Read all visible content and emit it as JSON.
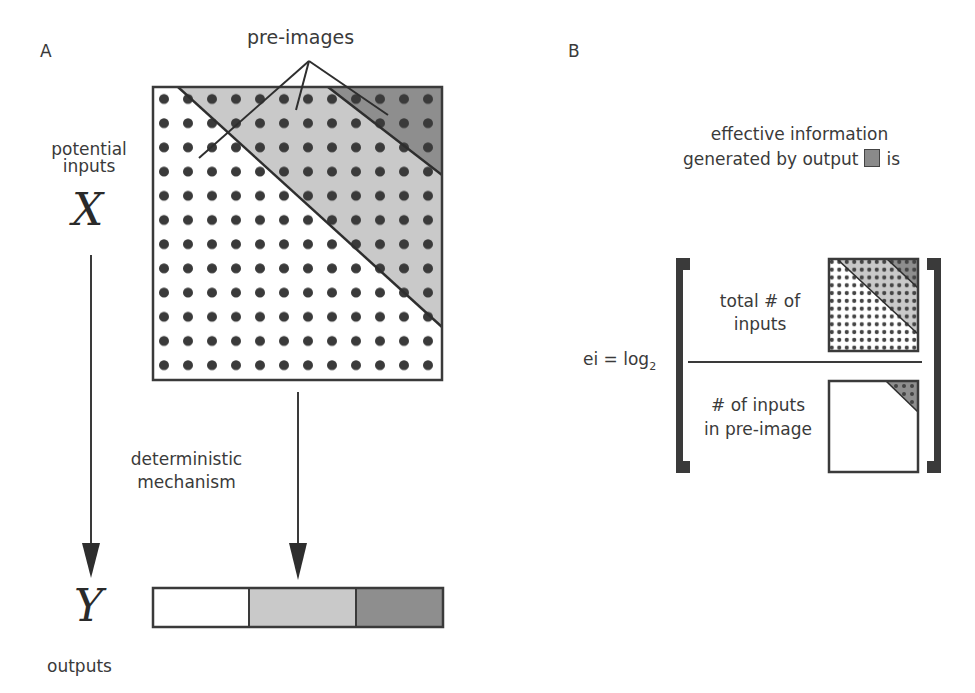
{
  "panel_a": {
    "label": "A",
    "preimages_label": "pre-images",
    "inputs_label_line1": "potential",
    "inputs_label_line2": "inputs",
    "inputs_symbol": "X",
    "outputs_symbol": "Y",
    "outputs_label": "outputs",
    "mechanism_line1": "deterministic",
    "mechanism_line2": "mechanism",
    "grid": {
      "rows": 12,
      "cols": 12
    },
    "regions": [
      {
        "name": "white-region",
        "color": "#ffffff"
      },
      {
        "name": "light-gray-preimage",
        "color": "#c8c8c8"
      },
      {
        "name": "dark-gray-preimage",
        "color": "#8c8c8c"
      }
    ],
    "output_states": [
      {
        "name": "output-white",
        "color": "#ffffff"
      },
      {
        "name": "output-light-gray",
        "color": "#c8c8c8"
      },
      {
        "name": "output-dark-gray",
        "color": "#8c8c8c"
      }
    ]
  },
  "panel_b": {
    "label": "B",
    "title_line1": "effective information",
    "title_line2_prefix": "generated by output",
    "title_line2_suffix": "is",
    "formula_lhs": "ei = log",
    "formula_subscript": "2",
    "numerator_line1": "total # of",
    "numerator_line2": "inputs",
    "denominator_line1": "# of inputs",
    "denominator_line2": "in pre-image"
  }
}
